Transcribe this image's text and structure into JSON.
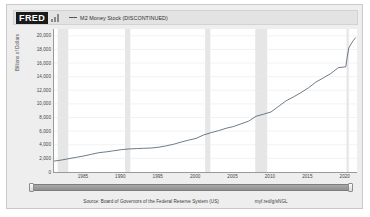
{
  "header": {
    "logo_text": "FRED",
    "logo_icon": "bar-chart-icon",
    "legend_label": "M2 Money Stock (DISCONTINUED)",
    "series_color": "#4a5a6a"
  },
  "footer": {
    "source": "Source: Board of Governors of the Federal Reserve System (US)",
    "permalink": "myf.red/g/sNGL"
  },
  "slider": {
    "left_handle": "slider-handle-left",
    "right_handle": "slider-handle-right"
  },
  "chart_data": {
    "type": "line",
    "title": "M2 Money Stock (DISCONTINUED)",
    "xlabel": "",
    "ylabel": "Billions of Dollars",
    "xlim": [
      1981,
      2021.5
    ],
    "ylim": [
      0,
      21000
    ],
    "grid": true,
    "legend_position": "top",
    "y_ticks": [
      0,
      2000,
      4000,
      6000,
      8000,
      10000,
      12000,
      14000,
      16000,
      18000,
      20000
    ],
    "y_tick_labels": [
      "0",
      "2,000",
      "4,000",
      "6,000",
      "8,000",
      "10,000",
      "12,000",
      "14,000",
      "16,000",
      "18,000",
      "20,000"
    ],
    "x_ticks": [
      1985,
      1990,
      1995,
      2000,
      2005,
      2010,
      2015,
      2020
    ],
    "x_tick_labels": [
      "1985",
      "1990",
      "1995",
      "2000",
      "2005",
      "2010",
      "2015",
      "2020"
    ],
    "recession_bands": [
      {
        "start": 1981.5,
        "end": 1982.9
      },
      {
        "start": 1990.5,
        "end": 1991.2
      },
      {
        "start": 2001.2,
        "end": 2001.9
      },
      {
        "start": 2007.9,
        "end": 2009.5
      },
      {
        "start": 2020.1,
        "end": 2020.4
      }
    ],
    "series": [
      {
        "name": "M2 Money Stock (DISCONTINUED)",
        "color": "#4a5a6a",
        "x": [
          1981,
          1982,
          1983,
          1984,
          1985,
          1986,
          1987,
          1988,
          1989,
          1990,
          1991,
          1992,
          1993,
          1994,
          1995,
          1996,
          1997,
          1998,
          1999,
          2000,
          2001,
          2002,
          2003,
          2004,
          2005,
          2006,
          2007,
          2008,
          2009,
          2010,
          2011,
          2012,
          2013,
          2014,
          2015,
          2016,
          2017,
          2018,
          2019,
          2020,
          2020.2,
          2020.4,
          2020.7,
          2021,
          2021.3
        ],
        "values": [
          1600,
          1760,
          1960,
          2160,
          2360,
          2600,
          2840,
          2960,
          3120,
          3280,
          3380,
          3440,
          3480,
          3520,
          3640,
          3840,
          4080,
          4400,
          4680,
          4940,
          5440,
          5780,
          6070,
          6420,
          6680,
          7070,
          7460,
          8180,
          8490,
          8810,
          9620,
          10440,
          11020,
          11650,
          12350,
          13200,
          13820,
          14460,
          15320,
          15450,
          16900,
          18200,
          18800,
          19300,
          19700
        ]
      }
    ]
  }
}
